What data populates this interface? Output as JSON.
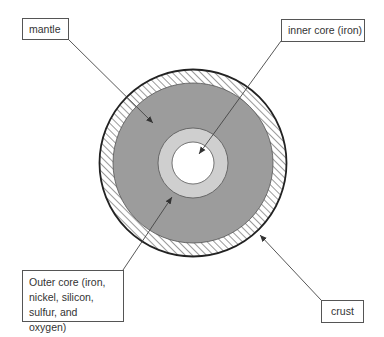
{
  "diagram": {
    "labels": {
      "mantle": "mantle",
      "inner_core": "inner core (iron)",
      "outer_core": "Outer core (iron, nickel, silicon, sulfur, and oxygen)",
      "crust": "crust"
    },
    "layers": [
      {
        "name": "crust",
        "fill": "hatched",
        "color": "#ffffff",
        "radius": 94
      },
      {
        "name": "mantle",
        "fill": "solid",
        "color": "#9c9c9c",
        "radius": 80
      },
      {
        "name": "outer_core",
        "fill": "solid",
        "color": "#cfcfcf",
        "radius": 35
      },
      {
        "name": "inner_core",
        "fill": "solid",
        "color": "#ffffff",
        "radius": 21
      }
    ],
    "center": {
      "x": 193,
      "y": 163
    }
  }
}
